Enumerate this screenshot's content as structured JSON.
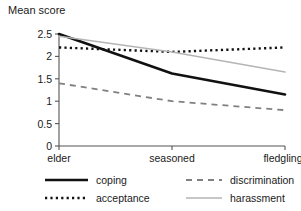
{
  "chart_data": {
    "type": "line",
    "title": "",
    "xlabel": "",
    "ylabel": "Mean score",
    "categories": [
      "elder",
      "seasoned",
      "fledgling"
    ],
    "ylim": [
      0,
      2.5
    ],
    "yticks": [
      0,
      0.5,
      1,
      1.5,
      2,
      2.5
    ],
    "ytick_labels": [
      "0",
      "0.5",
      "1",
      "1.5",
      "2",
      "2.5"
    ],
    "grid": false,
    "legend_position": "below",
    "series": [
      {
        "name": "coping",
        "values": [
          2.5,
          1.62,
          1.15
        ],
        "style": "solid",
        "color": "#111111",
        "width": 2.6
      },
      {
        "name": "acceptance",
        "values": [
          2.2,
          2.1,
          2.2
        ],
        "style": "dotted",
        "color": "#111111",
        "width": 2.4
      },
      {
        "name": "discrimination",
        "values": [
          1.4,
          1.0,
          0.8
        ],
        "style": "dashed",
        "color": "#808080",
        "width": 1.8
      },
      {
        "name": "harassment",
        "values": [
          2.45,
          2.1,
          1.65
        ],
        "style": "solid",
        "color": "#b5b5b5",
        "width": 1.5
      }
    ]
  },
  "axis": {
    "line_color": "#555555",
    "y_label": "Mean score"
  },
  "legend": {
    "entries": [
      {
        "label": "coping",
        "key": "coping"
      },
      {
        "label": "discrimination",
        "key": "discrimination"
      },
      {
        "label": "acceptance",
        "key": "acceptance"
      },
      {
        "label": "harassment",
        "key": "harassment"
      }
    ]
  }
}
